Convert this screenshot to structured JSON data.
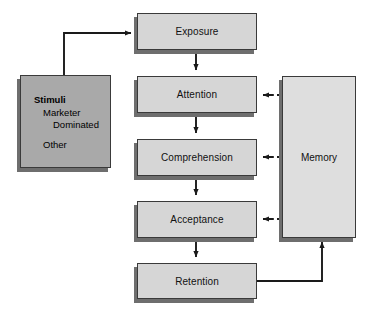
{
  "diagram": {
    "type": "flow-diagram",
    "background_color": "#ffffff",
    "node_fill_process": "#d6d6d6",
    "node_fill_memory": "#dedede",
    "node_fill_stimuli": "#a9a9a9",
    "node_border_color": "#3a3a3a",
    "shadow_color": "#6e6e6e",
    "connector_color": "#1a1a1a"
  },
  "nodes": {
    "stimuli": {
      "name": "Stimuli",
      "lines": [
        {
          "text": "Stimuli",
          "style": "title"
        },
        {
          "text": "Marketer",
          "style": "sub1"
        },
        {
          "text": "Dominated",
          "style": "sub2"
        },
        {
          "text": "Other",
          "style": "other"
        }
      ]
    },
    "exposure": {
      "label": "Exposure"
    },
    "attention": {
      "label": "Attention"
    },
    "comprehension": {
      "label": "Comprehension"
    },
    "acceptance": {
      "label": "Acceptance"
    },
    "retention": {
      "label": "Retention"
    },
    "memory": {
      "label": "Memory"
    }
  },
  "edges": [
    {
      "id": "stimuli-to-exposure",
      "from": "Stimuli",
      "to": "Exposure",
      "style": "solid",
      "arrow": "right"
    },
    {
      "id": "exposure-to-attention",
      "from": "Exposure",
      "to": "Attention",
      "style": "solid",
      "arrow": "down"
    },
    {
      "id": "attention-to-comprehension",
      "from": "Attention",
      "to": "Comprehension",
      "style": "solid",
      "arrow": "down"
    },
    {
      "id": "comprehension-to-acceptance",
      "from": "Comprehension",
      "to": "Acceptance",
      "style": "solid",
      "arrow": "down"
    },
    {
      "id": "acceptance-to-retention",
      "from": "Acceptance",
      "to": "Retention",
      "style": "solid",
      "arrow": "down"
    },
    {
      "id": "memory-to-attention",
      "from": "Memory",
      "to": "Attention",
      "style": "dashed",
      "arrow": "left"
    },
    {
      "id": "memory-to-comprehension",
      "from": "Memory",
      "to": "Comprehension",
      "style": "dashed",
      "arrow": "left"
    },
    {
      "id": "memory-to-acceptance",
      "from": "Memory",
      "to": "Acceptance",
      "style": "dashed",
      "arrow": "left"
    },
    {
      "id": "retention-to-memory",
      "from": "Retention",
      "to": "Memory",
      "style": "solid",
      "arrow": "up"
    }
  ]
}
